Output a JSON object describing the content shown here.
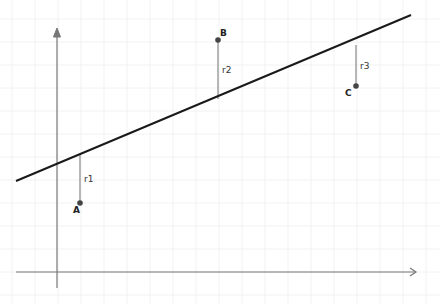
{
  "diagram": {
    "type": "linear-regression-residuals",
    "colors": {
      "background": "#ffffff",
      "grid": "#f2f2f2",
      "axis": "#777777",
      "regression_line": "#1a1a1a",
      "residual": "#888888",
      "point": "#444444"
    },
    "axes": {
      "x_axis": {
        "x1": 16,
        "x2": 416,
        "y": 272
      },
      "y_axis": {
        "x": 57,
        "y1": 28,
        "y2": 288
      }
    },
    "regression_line": {
      "x1": 16,
      "y1": 181,
      "x2": 411,
      "y2": 15
    },
    "points": [
      {
        "label": "A",
        "x": 80,
        "y": 203,
        "line_y": 154
      },
      {
        "label": "B",
        "x": 218,
        "y": 40,
        "line_y": 99
      },
      {
        "label": "C",
        "x": 356,
        "y": 86,
        "line_y": 45
      }
    ],
    "residuals": [
      {
        "label": "r1",
        "from": "A"
      },
      {
        "label": "r2",
        "from": "B"
      },
      {
        "label": "r3",
        "from": "C"
      }
    ]
  }
}
